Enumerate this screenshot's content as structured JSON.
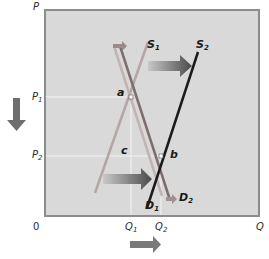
{
  "diagram": {
    "type": "supply-demand",
    "axes": {
      "y_label": "P",
      "x_label": "Q",
      "origin": "0",
      "price_levels": [
        {
          "label": "P",
          "sub": "1",
          "id": "p1"
        },
        {
          "label": "P",
          "sub": "2",
          "id": "p2"
        }
      ],
      "quantity_levels": [
        {
          "label": "Q",
          "sub": "1",
          "id": "q1"
        },
        {
          "label": "Q",
          "sub": "2",
          "id": "q2"
        }
      ]
    },
    "curves": [
      {
        "id": "s1",
        "label": "S",
        "sub": "1",
        "color": "#b09a9a"
      },
      {
        "id": "s2",
        "label": "S",
        "sub": "2",
        "color": "#1a1a1a"
      },
      {
        "id": "d1",
        "label": "D",
        "sub": "1",
        "color": "#1a1a1a"
      },
      {
        "id": "d2",
        "label": "D",
        "sub": "2",
        "color": "#7a6a6a"
      }
    ],
    "points": [
      {
        "label": "a"
      },
      {
        "label": "b"
      },
      {
        "label": "c"
      }
    ],
    "arrows": {
      "supply_shift": "right",
      "demand_shift": "right",
      "price_change": "down",
      "quantity_change": "right"
    },
    "colors": {
      "plot_background": "#d9d9d9",
      "border": "#8c8c8c",
      "guide_lines": "#f2f2f2",
      "arrow": "#6e6e6e"
    }
  }
}
